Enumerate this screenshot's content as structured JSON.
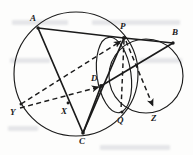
{
  "figure": {
    "kind": "geometry-diagram",
    "width": 193,
    "height": 155,
    "background_color": "#fdfdfc",
    "stroke_color": "#1b1b1b",
    "labels": [
      {
        "id": "A",
        "text": "A",
        "x": 30,
        "y": 18
      },
      {
        "id": "P",
        "text": "P",
        "x": 120,
        "y": 24
      },
      {
        "id": "B",
        "text": "B",
        "x": 171,
        "y": 31
      },
      {
        "id": "D",
        "text": "D",
        "x": 92,
        "y": 77
      },
      {
        "id": "Y",
        "text": "Y",
        "x": 10,
        "y": 110
      },
      {
        "id": "X",
        "text": "X",
        "x": 60,
        "y": 110
      },
      {
        "id": "Q",
        "text": "Q",
        "x": 117,
        "y": 118
      },
      {
        "id": "Z",
        "text": "Z",
        "x": 150,
        "y": 117
      },
      {
        "id": "C",
        "text": "C",
        "x": 78,
        "y": 139
      }
    ],
    "points": [
      {
        "id": "A",
        "x": 38,
        "y": 28
      },
      {
        "id": "P",
        "x": 124,
        "y": 38
      },
      {
        "id": "B",
        "x": 173,
        "y": 43
      },
      {
        "id": "D",
        "x": 101,
        "y": 86
      },
      {
        "id": "Y",
        "x": 21,
        "y": 104
      },
      {
        "id": "X",
        "x": 68,
        "y": 103
      },
      {
        "id": "Q",
        "x": 122,
        "y": 112
      },
      {
        "id": "Z",
        "x": 155,
        "y": 110
      },
      {
        "id": "C",
        "x": 83,
        "y": 133
      }
    ],
    "circles": [
      {
        "id": "big-circle",
        "cx": 76,
        "cy": 74,
        "r": 62,
        "style": "solid"
      },
      {
        "id": "right-circle",
        "cx": 146,
        "cy": 76,
        "r": 37,
        "style": "solid"
      },
      {
        "id": "small-circle",
        "cx": 114,
        "cy": 75,
        "rx": 17,
        "ry": 38,
        "rot": -8,
        "style": "solid"
      }
    ],
    "solid_segments": [
      {
        "id": "A-P",
        "from": "A",
        "to": "P"
      },
      {
        "id": "P-B",
        "from": "P",
        "to": "B"
      },
      {
        "id": "A-C",
        "from": "A",
        "to": "C"
      },
      {
        "id": "C-P",
        "from": "C",
        "to": "P"
      },
      {
        "id": "C-D",
        "from": "C",
        "to": "D"
      },
      {
        "id": "D-B",
        "from": "D",
        "to": "B"
      }
    ],
    "dashed_segments": [
      {
        "id": "Y-P",
        "from": "Y",
        "to": "P",
        "arrow": true
      },
      {
        "id": "X-D",
        "from": "X",
        "to": "D",
        "arrow": true
      },
      {
        "id": "P-Q",
        "from": "P",
        "to": "Q",
        "arrow": false
      },
      {
        "id": "P-Z",
        "from": "P",
        "to": "Z",
        "arrow": true
      }
    ]
  }
}
